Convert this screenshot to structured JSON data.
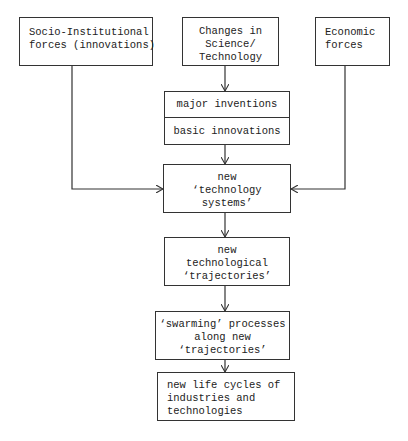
{
  "diagram": {
    "top_boxes": {
      "socio_institutional": [
        "Socio-Institutional",
        "forces (innovations)"
      ],
      "science_technology": [
        "Changes in",
        "Science/",
        "Technology"
      ],
      "economic": [
        "Economic",
        "forces"
      ]
    },
    "inventions_box": {
      "upper": "major inventions",
      "lower": "basic innovations"
    },
    "technology_systems": [
      "new",
      "‘technology",
      "systems’"
    ],
    "trajectories": [
      "new",
      "technological",
      "‘trajectories’"
    ],
    "swarming": [
      "‘swarming’ processes",
      "along new",
      "‘trajectories’"
    ],
    "life_cycles": [
      "new life cycles of",
      "industries and",
      "technologies"
    ]
  }
}
